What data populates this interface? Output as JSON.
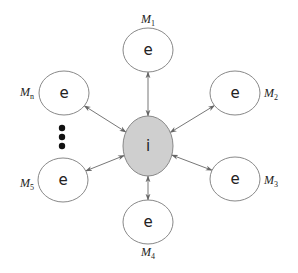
{
  "diagram": {
    "center": {
      "label": "i",
      "cx": 148,
      "cy": 146,
      "rx": 25,
      "ry": 30,
      "fill": "#cfcfcf"
    },
    "nodes": [
      {
        "id": "M1",
        "label": "e",
        "name_base": "M",
        "name_sub": "1",
        "cx": 148,
        "cy": 50,
        "lx": 148,
        "ly": 23,
        "anchor": "middle"
      },
      {
        "id": "M2",
        "label": "e",
        "name_base": "M",
        "name_sub": "2",
        "cx": 235,
        "cy": 93,
        "lx": 264,
        "ly": 97,
        "anchor": "start"
      },
      {
        "id": "M3",
        "label": "e",
        "name_base": "M",
        "name_sub": "3",
        "cx": 235,
        "cy": 179,
        "lx": 264,
        "ly": 184,
        "anchor": "start"
      },
      {
        "id": "M4",
        "label": "e",
        "name_base": "M",
        "name_sub": "4",
        "cx": 148,
        "cy": 222,
        "lx": 148,
        "ly": 256,
        "anchor": "middle"
      },
      {
        "id": "M5",
        "label": "e",
        "name_base": "M",
        "name_sub": "5",
        "cx": 63,
        "cy": 180,
        "lx": 34,
        "ly": 187,
        "anchor": "end"
      },
      {
        "id": "Mn",
        "label": "e",
        "name_base": "M",
        "name_sub": "n",
        "cx": 64,
        "cy": 93,
        "lx": 34,
        "ly": 96,
        "anchor": "end"
      }
    ],
    "node_rx": 25,
    "node_ry": 22,
    "ellipsis_dots": [
      {
        "cx": 62,
        "cy": 128
      },
      {
        "cx": 62,
        "cy": 137
      },
      {
        "cx": 62,
        "cy": 146
      }
    ],
    "edge_style": "bidirectional-arrow",
    "stroke_color": "#777777"
  }
}
